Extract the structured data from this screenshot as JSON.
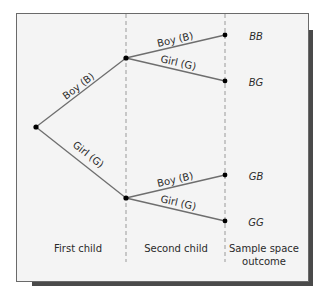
{
  "diagram": {
    "type": "tree-diagram",
    "first_level": {
      "branches": [
        {
          "label": "Boy (B)"
        },
        {
          "label": "Girl (G)"
        }
      ]
    },
    "second_level": {
      "from_boy": [
        {
          "label": "Boy (B)",
          "outcome": "BB"
        },
        {
          "label": "Girl (G)",
          "outcome": "BG"
        }
      ],
      "from_girl": [
        {
          "label": "Boy (B)",
          "outcome": "GB"
        },
        {
          "label": "Girl (G)",
          "outcome": "GG"
        }
      ]
    },
    "columns": {
      "first": "First child",
      "second": "Second child",
      "outcome_line1": "Sample space",
      "outcome_line2": "outcome"
    },
    "colors": {
      "background": "#f4f4f4",
      "border": "#6a6a6a",
      "shadow": "#4a4a4a",
      "branch": "#6e6e6e",
      "node": "#000000",
      "dash": "#9a9a9a"
    }
  }
}
